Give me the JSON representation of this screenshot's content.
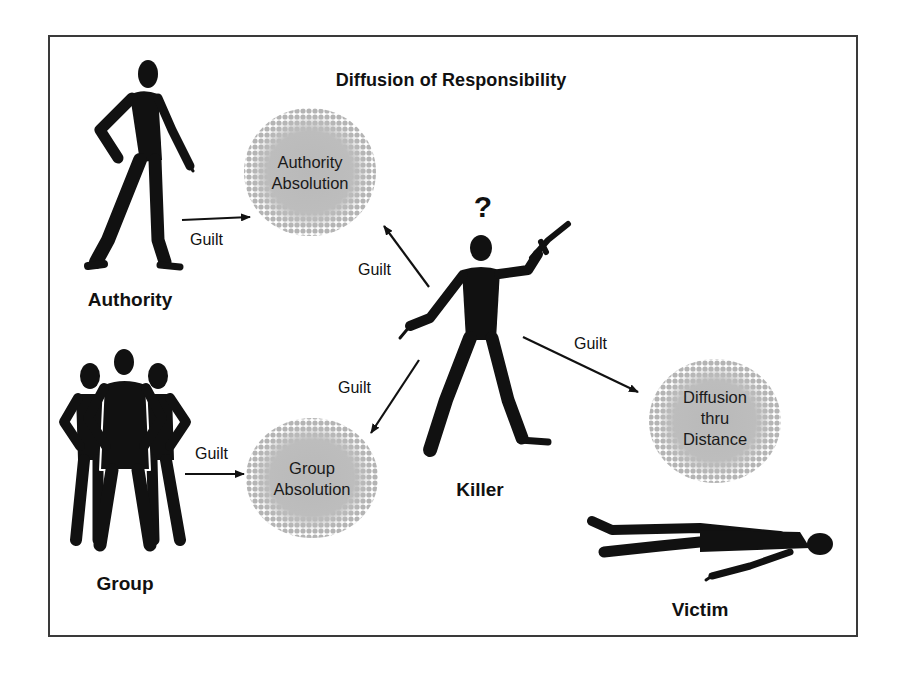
{
  "diagram": {
    "title": "Diffusion of Responsibility",
    "colors": {
      "ink": "#111111",
      "bubble_fill": "#b9b9b9",
      "frame": "#3a3a3a",
      "background": "#ffffff"
    },
    "actors": [
      {
        "id": "authority",
        "label": "Authority",
        "icon": "pointing-man-silhouette"
      },
      {
        "id": "group",
        "label": "Group",
        "icon": "three-people-silhouette"
      },
      {
        "id": "killer",
        "label": "Killer",
        "icon": "man-with-gun-silhouette",
        "badge": "?"
      },
      {
        "id": "victim",
        "label": "Victim",
        "icon": "lying-man-silhouette"
      }
    ],
    "bubbles": [
      {
        "id": "authority_absolution",
        "lines": [
          "Authority",
          "Absolution"
        ]
      },
      {
        "id": "group_absolution",
        "lines": [
          "Group",
          "Absolution"
        ]
      },
      {
        "id": "diffusion_distance",
        "lines": [
          "Diffusion",
          "thru",
          "Distance"
        ]
      }
    ],
    "edges": [
      {
        "from": "authority",
        "to": "authority_absolution",
        "label": "Guilt"
      },
      {
        "from": "killer",
        "to": "authority_absolution",
        "label": "Guilt"
      },
      {
        "from": "killer",
        "to": "group_absolution",
        "label": "Guilt"
      },
      {
        "from": "group",
        "to": "group_absolution",
        "label": "Guilt"
      },
      {
        "from": "killer",
        "to": "diffusion_distance",
        "label": "Guilt"
      }
    ]
  }
}
